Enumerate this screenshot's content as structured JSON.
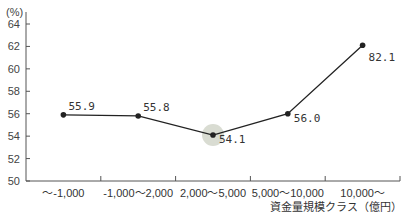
{
  "chart_data": {
    "type": "line",
    "title": "",
    "ylabel": "(%)",
    "xlabel": "資金量規模クラス（億円）",
    "ylim": [
      50,
      64
    ],
    "yticks": [
      50,
      52,
      54,
      56,
      58,
      60,
      62,
      64
    ],
    "grid": false,
    "categories": [
      "～-1,000",
      "-1,000～2,000",
      "2,000～5,000",
      "5,000～10,000",
      "10,000～"
    ],
    "series": [
      {
        "name": "ratio",
        "values": [
          55.9,
          55.8,
          54.1,
          56.0,
          62.1
        ],
        "labels": [
          "55.9",
          "55.8",
          "54.1",
          "56.0",
          "82.1"
        ]
      }
    ],
    "highlight_index": 2,
    "colors": {
      "line": "#222222",
      "highlight": "#d9dcd2",
      "axis": "#555555"
    }
  }
}
